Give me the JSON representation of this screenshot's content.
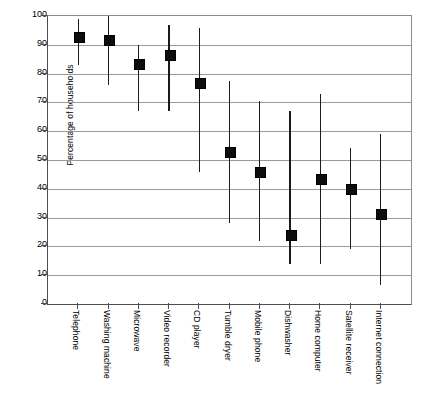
{
  "chart_data": {
    "type": "scatter",
    "title": "",
    "subtitle": "",
    "xlabel": "",
    "ylabel": "Percentage of households",
    "ylim": [
      0,
      100
    ],
    "yticks": [
      0,
      10,
      20,
      30,
      40,
      50,
      60,
      70,
      80,
      90,
      100
    ],
    "ytick_labels": [
      "0",
      "10",
      "20",
      "30",
      "40",
      "50",
      "60",
      "70",
      "80",
      "90",
      "100"
    ],
    "grid": "horizontal",
    "legend": "none",
    "marker_style": "filled-square",
    "error_bar_style": "vertical-range-line",
    "categories": [
      "Telephone",
      "Washing machine",
      "Microwave",
      "Video recorder",
      "CD player",
      "Tumble dryer",
      "Mobile phone",
      "Dishwasher",
      "Home computer",
      "Satellite receiver",
      "Internet connection"
    ],
    "series": [
      {
        "name": "Percentage of households",
        "values": [
          93,
          92,
          83.5,
          86.5,
          77,
          53,
          46,
          24,
          43.5,
          40,
          31.5
        ],
        "range_low": [
          83,
          76,
          67,
          67,
          46,
          28,
          22,
          14,
          14,
          19,
          6.5
        ],
        "range_high": [
          99,
          100,
          90,
          97,
          96,
          77.5,
          70.5,
          67,
          73,
          54,
          59
        ]
      }
    ],
    "colors": {
      "marker": "#0d0d0d",
      "line": "#1a1a1a",
      "grid": "#9a9a9a",
      "axis": "#4d4d4d",
      "background": "#ffffff",
      "text": "#000000"
    }
  }
}
